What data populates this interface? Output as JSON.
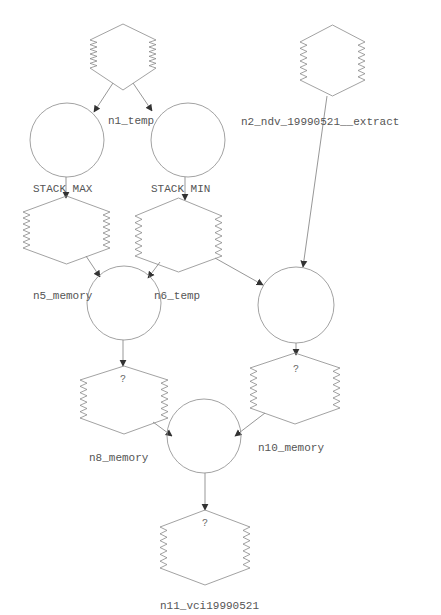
{
  "diagram": {
    "top_text": "",
    "colors": {
      "stroke": "#8a8a8a",
      "edge": "#6a6a6a",
      "text": "#555555",
      "background": "#ffffff"
    },
    "nodes": [
      {
        "id": "src_left",
        "shape": "stack-hexagon",
        "label": ""
      },
      {
        "id": "src_right",
        "shape": "stack-hexagon",
        "label": "n2_ndv_19990521__extract"
      },
      {
        "id": "op_max",
        "shape": "circle",
        "label": ""
      },
      {
        "id": "op_min",
        "shape": "circle",
        "label": "n1_temp"
      },
      {
        "id": "stack_max",
        "shape": "stack-hexagon",
        "label": "STACK MAX",
        "caption": "n5_memory"
      },
      {
        "id": "stack_min",
        "shape": "stack-hexagon",
        "label": "STACK MIN",
        "caption": "n6_temp"
      },
      {
        "id": "op_merge1",
        "shape": "circle",
        "label": ""
      },
      {
        "id": "op_merge2",
        "shape": "circle",
        "label": ""
      },
      {
        "id": "n8",
        "shape": "stack-hexagon",
        "label": "?",
        "caption": "n8_memory"
      },
      {
        "id": "n10",
        "shape": "stack-hexagon",
        "label": "?",
        "caption": "n10_memory"
      },
      {
        "id": "op_final",
        "shape": "circle",
        "label": ""
      },
      {
        "id": "n11",
        "shape": "stack-hexagon",
        "label": "?",
        "caption": "n11_vci19990521"
      }
    ],
    "edges": [
      {
        "from": "src_left",
        "to": "op_max"
      },
      {
        "from": "src_left",
        "to": "op_min"
      },
      {
        "from": "op_max",
        "to": "stack_max"
      },
      {
        "from": "op_min",
        "to": "stack_min"
      },
      {
        "from": "stack_max",
        "to": "op_merge1"
      },
      {
        "from": "stack_min",
        "to": "op_merge1"
      },
      {
        "from": "stack_min",
        "to": "op_merge2"
      },
      {
        "from": "src_right",
        "to": "op_merge2"
      },
      {
        "from": "op_merge1",
        "to": "n8"
      },
      {
        "from": "op_merge2",
        "to": "n10"
      },
      {
        "from": "n8",
        "to": "op_final"
      },
      {
        "from": "n10",
        "to": "op_final"
      },
      {
        "from": "op_final",
        "to": "n11"
      }
    ],
    "labels": {
      "n1_temp": "n1_temp",
      "n2": "n2_ndv_19990521__extract",
      "stack_max": "STACK MAX",
      "stack_min": "STACK MIN",
      "n5": "n5_memory",
      "n6": "n6_temp",
      "q1": "?",
      "q2": "?",
      "q3": "?",
      "n8": "n8_memory",
      "n10": "n10_memory",
      "n11": "n11_vci19990521"
    }
  }
}
